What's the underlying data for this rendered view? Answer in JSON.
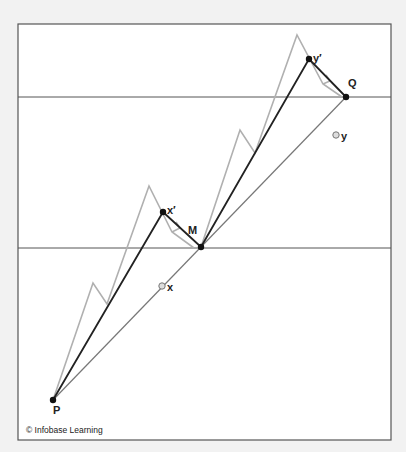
{
  "diagram": {
    "frame": {
      "x": 18,
      "y": 24,
      "width": 373,
      "height": 416,
      "stroke": "#555555",
      "background": "#ffffff"
    },
    "page_background": "#f2f2f2",
    "horizontal_lines": [
      {
        "name": "upper-line",
        "y": 97
      },
      {
        "name": "lower-line",
        "y": 248
      }
    ],
    "points": {
      "P": {
        "x": 53,
        "y": 400,
        "label": "P",
        "style": "filled"
      },
      "M": {
        "x": 201,
        "y": 247,
        "label": "M",
        "style": "filled"
      },
      "Q": {
        "x": 346,
        "y": 97,
        "label": "Q",
        "style": "filled"
      },
      "x_prime": {
        "x": 163,
        "y": 212,
        "label": "x′",
        "style": "filled"
      },
      "y_prime": {
        "x": 309,
        "y": 59,
        "label": "y′",
        "style": "filled"
      },
      "x": {
        "x": 162,
        "y": 286,
        "label": "x",
        "style": "open"
      },
      "y": {
        "x": 336,
        "y": 135,
        "label": "y",
        "style": "open"
      }
    },
    "colors": {
      "dark_line": "#222222",
      "mid_line": "#777777",
      "gray_path": "#b0b0b0",
      "point_fill": "#111111",
      "open_point_fill": "#dddddd"
    },
    "copyright": "© Infobase Learning"
  }
}
